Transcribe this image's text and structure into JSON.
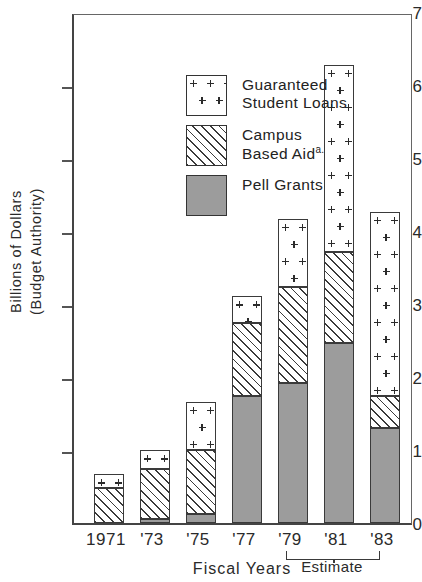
{
  "chart_data": {
    "type": "bar",
    "subtype": "stacked",
    "title": "",
    "xlabel": "Fiscal  Years",
    "ylabel": "Billions of Dollars\n(Budget Authority)",
    "categories": [
      "1971",
      "'73",
      "'75",
      "'77",
      "'79",
      "'81",
      "'83"
    ],
    "ylim": [
      0,
      7
    ],
    "yticks": [
      0,
      1,
      2,
      3,
      4,
      5,
      6,
      7
    ],
    "ytick_labels": [
      "0",
      "1",
      "2",
      "3",
      "4",
      "5",
      "6",
      "7"
    ],
    "grid": false,
    "legend_position": "upper-left",
    "series": [
      {
        "name": "Pell Grants",
        "pattern": "solid-gray",
        "color": "#9c9c9c",
        "values": [
          0.0,
          0.05,
          0.12,
          1.74,
          1.92,
          2.47,
          1.3
        ]
      },
      {
        "name": "Campus Based Aid",
        "pattern": "diagonal-hatch",
        "color": "#ffffff",
        "values": [
          0.48,
          0.69,
          0.88,
          1.01,
          1.33,
          1.26,
          0.45
        ]
      },
      {
        "name": "Guaranteed Student Loans",
        "pattern": "plus-dots",
        "color": "#ffffff",
        "values": [
          0.19,
          0.26,
          0.67,
          0.37,
          0.93,
          2.57,
          2.53
        ]
      }
    ],
    "cumulative_tops": {
      "pell": [
        0.0,
        0.05,
        0.12,
        1.74,
        1.92,
        2.47,
        1.3
      ],
      "campus": [
        0.48,
        0.74,
        1.0,
        2.75,
        3.25,
        3.73,
        1.75
      ],
      "total": [
        0.67,
        1.0,
        1.67,
        3.12,
        4.18,
        6.3,
        4.28
      ]
    },
    "annotations": [
      {
        "text": "Estimate",
        "covers": [
          "'81",
          "'83"
        ],
        "type": "bracket"
      },
      {
        "text": "a.",
        "attached_to": "Campus Based Aid",
        "type": "footnote-marker"
      }
    ]
  },
  "axes": {
    "y_title_line1": "Billions of Dollars",
    "y_title_line2": "(Budget Authority)",
    "y_title": "Billions of  Dollars\n(Budget Authority)",
    "x_title": "Fiscal  Years",
    "y_ticks": [
      "7",
      "6",
      "5",
      "4",
      "3",
      "2",
      "1",
      "0"
    ],
    "x_ticks": [
      "1971",
      "'73",
      "'75",
      "'77",
      "'79",
      "'81",
      "'83"
    ]
  },
  "legend": {
    "items": [
      {
        "label": "Guaranteed\nStudent Loans",
        "pattern": "plus-dots",
        "footnote": ""
      },
      {
        "label": "Campus\nBased Aid",
        "pattern": "diagonal-hatch",
        "footnote": "a."
      },
      {
        "label": "Pell  Grants",
        "pattern": "solid-gray",
        "footnote": ""
      }
    ]
  },
  "annotations": {
    "estimate_label": "Estimate"
  },
  "colors": {
    "pell_fill": "#9c9c9c",
    "outline": "#3a3a3a",
    "axis": "#444444",
    "text": "#2a2a2a"
  }
}
